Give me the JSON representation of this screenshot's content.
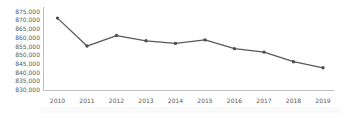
{
  "chart_data": {
    "type": "line",
    "categories": [
      "2010",
      "2011",
      "2012",
      "2013",
      "2014",
      "2015",
      "2016",
      "2017",
      "2018",
      "2019"
    ],
    "values": [
      871500,
      855500,
      861500,
      858500,
      857000,
      859000,
      854000,
      852000,
      846500,
      843000
    ],
    "xlabel": "",
    "ylabel": "",
    "ylim": [
      830000,
      875000
    ],
    "ytick_step": 5000,
    "yticks": [
      "875,000",
      "870,000",
      "865,000",
      "860,000",
      "855,000",
      "850,000",
      "845,000",
      "840,000",
      "835,000",
      "830,000"
    ],
    "grid": false,
    "legend_position": "none",
    "marker": "circle",
    "colors": {
      "line": "#595959",
      "marker": "#4f4f4f",
      "axis": "#bfbfbf",
      "tick_label": "#595959"
    }
  }
}
